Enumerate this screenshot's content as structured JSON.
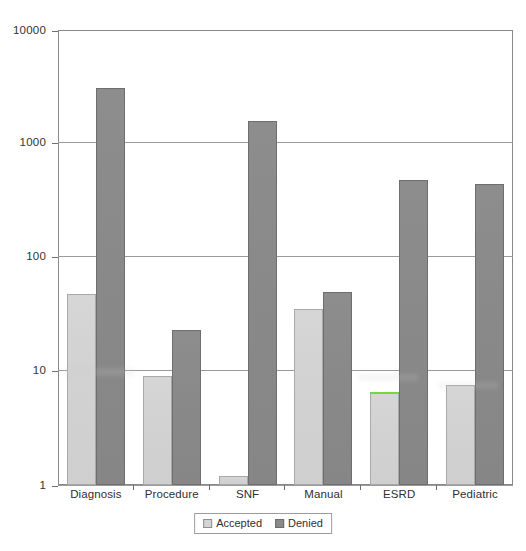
{
  "chart_data": {
    "type": "bar",
    "title": "",
    "subtitle": "",
    "xlabel": "",
    "ylabel": "",
    "scale": "log10",
    "ylim": [
      1,
      10000
    ],
    "ytick_labels": [
      "10000",
      "1000",
      "100",
      "10",
      "1"
    ],
    "ytick_values": [
      10000,
      1000,
      100,
      10,
      1
    ],
    "grid": true,
    "legend_position": "bottom-center",
    "categories": [
      "Diagnosis",
      "Procedure",
      "SNF",
      "Manual",
      "ESRD",
      "Pediatric"
    ],
    "series": [
      {
        "name": "Accepted",
        "color": "#d4d4d4",
        "values": [
          48,
          9,
          1.2,
          35,
          6.6,
          7.5
        ]
      },
      {
        "name": "Denied",
        "color": "#8a8a8a",
        "values": [
          3100,
          23,
          1600,
          50,
          480,
          440
        ]
      }
    ],
    "annotations": [
      {
        "text": "green highlighter mark across top of ESRD Accepted bar",
        "color": "#6fdc3c",
        "category": "ESRD",
        "series": "Accepted"
      }
    ]
  },
  "legend": {
    "items": [
      {
        "label": "Accepted",
        "swatch": "accepted"
      },
      {
        "label": "Denied",
        "swatch": "denied"
      }
    ]
  },
  "axis": {
    "y_labels": [
      "10000",
      "1000",
      "100",
      "10",
      "1"
    ],
    "x_labels": [
      "Diagnosis",
      "Procedure",
      "SNF",
      "Manual",
      "ESRD",
      "Pediatric"
    ]
  }
}
